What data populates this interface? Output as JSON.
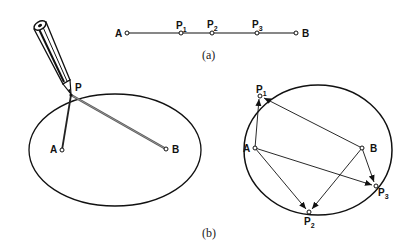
{
  "figure": {
    "part_a": {
      "caption": "(a)",
      "points": [
        {
          "name": "A",
          "label": "A",
          "sub": ""
        },
        {
          "name": "P1",
          "label": "P",
          "sub": "1"
        },
        {
          "name": "P2",
          "label": "P",
          "sub": "2"
        },
        {
          "name": "P3",
          "label": "P",
          "sub": "3"
        },
        {
          "name": "B",
          "label": "B",
          "sub": ""
        }
      ]
    },
    "part_b": {
      "caption": "(b)",
      "left": {
        "pencil_point_label": "P",
        "focus_a_label": "A",
        "focus_b_label": "B"
      },
      "right": {
        "focus_a_label": "A",
        "focus_b_label": "B",
        "points": [
          {
            "label": "P",
            "sub": "1"
          },
          {
            "label": "P",
            "sub": "2"
          },
          {
            "label": "P",
            "sub": "3"
          }
        ]
      }
    },
    "colors": {
      "ink": "#111111",
      "background": "#ffffff",
      "string": "#555555"
    }
  }
}
